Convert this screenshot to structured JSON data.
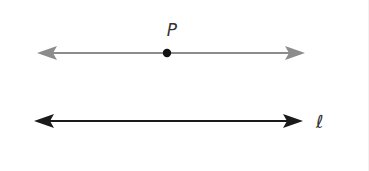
{
  "diagram": {
    "colors": {
      "upper_line": "#8c8c8c",
      "lower_line": "#1a1a1a",
      "point": "#111111",
      "label": "#333333"
    },
    "upper_line": {
      "name": "line-through-P",
      "arrows": "both",
      "point": {
        "label": "P"
      }
    },
    "lower_line": {
      "name": "line-l",
      "arrows": "both",
      "label": "ℓ"
    }
  }
}
